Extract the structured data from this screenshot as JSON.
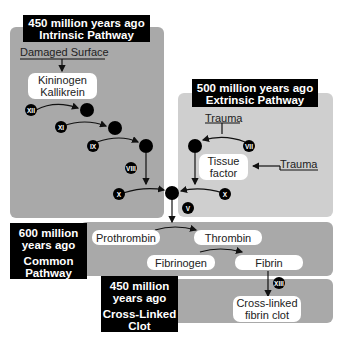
{
  "intrinsic": {
    "label_line1": "450 million years ago",
    "label_line2": "Intrinsic Pathway",
    "trigger": "Damaged Surface",
    "complex_line1": "Kininogen",
    "complex_line2": "Kallikrein",
    "factors": [
      "XII",
      "XI",
      "IX",
      "VIII",
      "X"
    ]
  },
  "extrinsic": {
    "label_line1": "500 million years ago",
    "label_line2": "Extrinsic Pathway",
    "trigger_top": "Trauma",
    "trigger_side": "Trauma",
    "tissue_line1": "Tissue",
    "tissue_line2": "factor",
    "factors": [
      "VII",
      "X"
    ]
  },
  "junction": {
    "factor": "V"
  },
  "common": {
    "label_line1": "600 million",
    "label_line2": "years ago",
    "label_line3": "Common",
    "label_line4": "Pathway",
    "prothrombin": "Prothrombin",
    "thrombin": "Thrombin",
    "fibrinogen": "Fibrinogen",
    "fibrin": "Fibrin"
  },
  "crosslinked": {
    "label_line1": "450 million",
    "label_line2": "years ago",
    "label_line3": "Cross-Linked",
    "label_line4": "Clot",
    "factor": "XIII",
    "clot_line1": "Cross-linked",
    "clot_line2": "fibrin clot"
  },
  "colors": {
    "dark_panel": "#a9a9a9",
    "light_panel": "#cfcfcf",
    "label_bg": "#000000"
  }
}
